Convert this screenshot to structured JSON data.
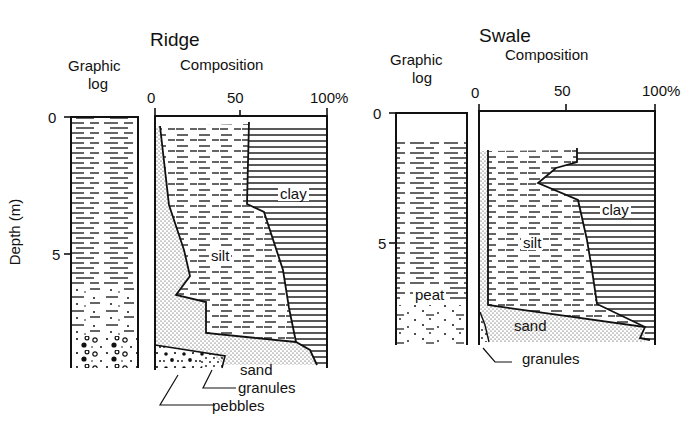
{
  "figure": {
    "y_axis_label": "Depth (m)",
    "y_ticks": [
      "0",
      "5"
    ],
    "x_ticks": [
      "0",
      "50",
      "100%"
    ],
    "column_headers": {
      "log": [
        "Graphic",
        "log"
      ],
      "composition": "Composition"
    },
    "legend_fills": {
      "clay": "horizontal-solid-lines",
      "silt": "horizontal-dashed-lines",
      "sand": "fine-dots",
      "granules": "coarse-dots",
      "pebbles": "large-dots-circles",
      "peat": "dashed-with-dots"
    },
    "ink_color": "#111111",
    "paper_color": "#ffffff"
  },
  "panels": [
    {
      "title": "Ridge",
      "log_label": [
        "Graphic",
        "log"
      ],
      "composition_label": "Composition",
      "labels": {
        "clay": "clay",
        "silt": "silt",
        "sand": "sand",
        "granules": "granules",
        "pebbles": "pebbles"
      },
      "depth_range_m": [
        0,
        9.1
      ],
      "profile": [
        {
          "depth": 0.3,
          "sand": 2,
          "silt_upper": 58
        },
        {
          "depth": 2.8,
          "sand": 5,
          "silt_upper": 56
        },
        {
          "depth": 3.8,
          "sand": 11,
          "silt_upper": 70
        },
        {
          "depth": 5.5,
          "sand": 18,
          "silt_upper": 76
        },
        {
          "depth": 6.6,
          "sand": 16,
          "silt_upper": 76
        },
        {
          "depth": 7.0,
          "sand": 25,
          "silt_upper": 77
        },
        {
          "depth": 8.3,
          "sand": 30,
          "silt_upper": 85
        },
        {
          "depth": 8.8,
          "sand": 30,
          "silt_upper": 97
        }
      ]
    },
    {
      "title": "Swale",
      "log_label": [
        "Graphic",
        "log"
      ],
      "composition_label": "Composition",
      "labels": {
        "clay": "clay",
        "silt": "silt",
        "sand": "sand",
        "granules": "granules",
        "peat": "peat"
      },
      "depth_range_m": [
        0,
        8.9
      ],
      "profile": [
        {
          "depth": 1.4,
          "sand": 5,
          "silt_upper": 56
        },
        {
          "depth": 2.7,
          "sand": 5,
          "silt_upper": 55
        },
        {
          "depth": 3.6,
          "sand": 5,
          "silt_upper": 34
        },
        {
          "depth": 4.4,
          "sand": 5,
          "silt_upper": 53
        },
        {
          "depth": 6.3,
          "sand": 5,
          "silt_upper": 57
        },
        {
          "depth": 7.4,
          "sand": 5,
          "silt_upper": 64
        },
        {
          "depth": 8.6,
          "sand": 93,
          "silt_upper": 96
        }
      ]
    }
  ]
}
